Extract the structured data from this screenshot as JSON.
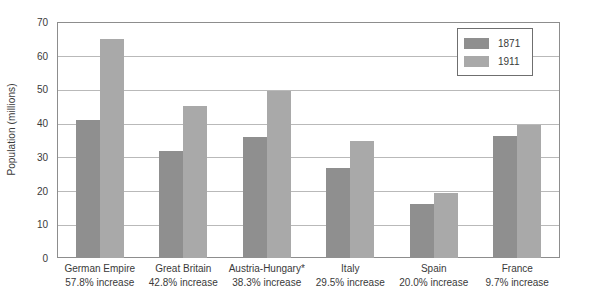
{
  "chart_data": {
    "type": "bar",
    "title": "",
    "subtitle": "",
    "xlabel": "",
    "ylabel": "Population (millions)",
    "ylim": [
      0,
      70
    ],
    "ytick_step": 10,
    "yticks": [
      "0",
      "10",
      "20",
      "30",
      "40",
      "50",
      "60",
      "70"
    ],
    "grid": true,
    "legend_position": "top-right",
    "categories": [
      "German Empire",
      "Great Britain",
      "Austria-Hungary*",
      "Italy",
      "Spain",
      "France"
    ],
    "category_sublabels": [
      "57.8% increase",
      "42.8% increase",
      "38.3% increase",
      "29.5% increase",
      "20.0% increase",
      "9.7% increase"
    ],
    "series": [
      {
        "name": "1871",
        "color": "#8f8f8f",
        "values": [
          41.0,
          31.6,
          35.8,
          26.8,
          16.0,
          36.1
        ]
      },
      {
        "name": "1911",
        "color": "#a9a9a9",
        "values": [
          64.9,
          45.2,
          49.5,
          34.7,
          19.2,
          39.6
        ]
      }
    ]
  },
  "legend": {
    "entries": [
      {
        "label": "1871"
      },
      {
        "label": "1911"
      }
    ]
  }
}
